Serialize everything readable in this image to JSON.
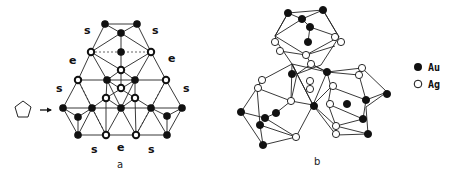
{
  "panel_a": {
    "caption": "a",
    "labels": {
      "s_top_left": "s",
      "s_top_right": "s",
      "e_left": "e",
      "e_right": "e",
      "s_mid_left": "s",
      "s_mid_right": "s",
      "s_bottom_left": "s",
      "e_bottom": "e",
      "s_bottom_right": "s"
    },
    "view_symbol": "pentagon",
    "arrow": "→"
  },
  "panel_b": {
    "caption": "b"
  },
  "legend": {
    "items": [
      {
        "symbol": "filled-circle",
        "label": "Au"
      },
      {
        "symbol": "open-circle",
        "label": "Ag"
      }
    ]
  }
}
